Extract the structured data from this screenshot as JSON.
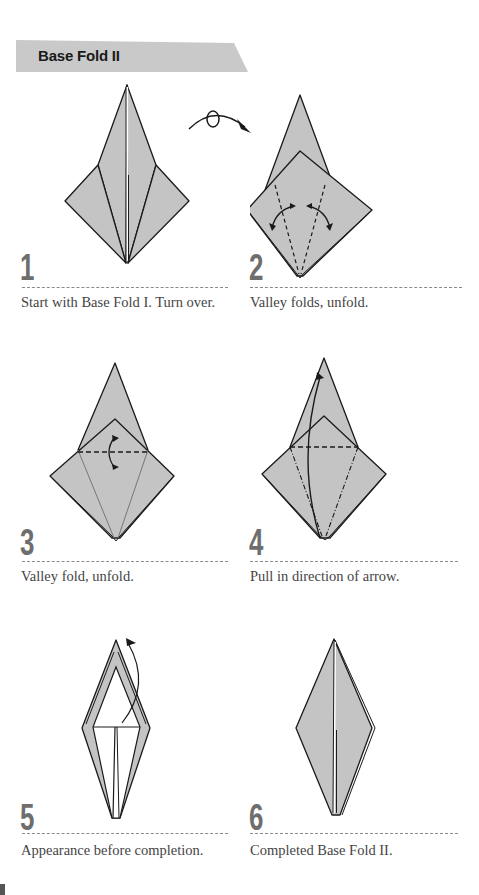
{
  "header": {
    "title": "Base Fold II",
    "banner_color": "#c9c9c9"
  },
  "colors": {
    "paper_fill": "#c4c4c4",
    "line": "#1a1a1a",
    "step_number": "#6e6e6e",
    "caption": "#444444"
  },
  "transitions": [
    {
      "between": [
        1,
        2
      ],
      "icon": "turn-over-arrow-icon"
    }
  ],
  "steps": [
    {
      "number": "1",
      "caption": "Start with Base Fold I. Turn over."
    },
    {
      "number": "2",
      "caption": "Valley folds, unfold."
    },
    {
      "number": "3",
      "caption": "Valley fold, unfold."
    },
    {
      "number": "4",
      "caption": "Pull in direction of arrow."
    },
    {
      "number": "5",
      "caption": "Appearance before completion."
    },
    {
      "number": "6",
      "caption": "Completed Base Fold II."
    }
  ]
}
